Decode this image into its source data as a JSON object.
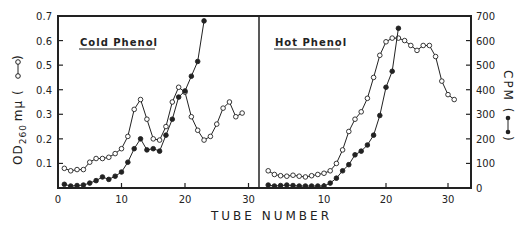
{
  "chart_data": {
    "type": "line",
    "title": "",
    "xlabel": "TUBE NUMBER",
    "ylabel_left": "OD260 mμ (○—○)",
    "ylabel_right": "CPM (●—●)",
    "left_axis": {
      "min": 0,
      "max": 0.7,
      "ticks": [
        "0.1",
        "0.2",
        "0.3",
        "0.4",
        "0.5",
        "0.6",
        "0.7"
      ]
    },
    "right_axis": {
      "min": 0,
      "max": 700,
      "ticks": [
        "0",
        "100",
        "200",
        "300",
        "400",
        "500",
        "600",
        "700"
      ]
    },
    "x_ticks": [
      "0",
      "10",
      "20",
      "30"
    ],
    "grid": false,
    "panels": [
      {
        "label": "Cold Phenol",
        "series": [
          {
            "name": "OD260 (open circles)",
            "marker": "open",
            "x": [
              1,
              2,
              3,
              4,
              5,
              6,
              7,
              8,
              9,
              10,
              11,
              12,
              13,
              14,
              15,
              16,
              17,
              18,
              19,
              20,
              21,
              22,
              23,
              24,
              25,
              26,
              27,
              28,
              29
            ],
            "values": [
              0.08,
              0.07,
              0.075,
              0.075,
              0.105,
              0.12,
              0.12,
              0.125,
              0.14,
              0.16,
              0.21,
              0.32,
              0.36,
              0.28,
              0.2,
              0.195,
              0.25,
              0.35,
              0.41,
              0.39,
              0.29,
              0.235,
              0.195,
              0.21,
              0.26,
              0.325,
              0.35,
              0.29,
              0.305
            ]
          },
          {
            "name": "CPM (filled circles)",
            "marker": "filled",
            "x": [
              1,
              2,
              3,
              4,
              5,
              6,
              7,
              8,
              9,
              10,
              11,
              12,
              13,
              14,
              15,
              16,
              17,
              18,
              19,
              20,
              21,
              22,
              23
            ],
            "values": [
              15,
              8,
              10,
              12,
              20,
              30,
              45,
              35,
              48,
              65,
              105,
              160,
              200,
              155,
              160,
              150,
              215,
              280,
              370,
              395,
              455,
              515,
              680
            ]
          }
        ]
      },
      {
        "label": "Hot Phenol",
        "series": [
          {
            "name": "OD260 (open circles)",
            "marker": "open",
            "x": [
              1,
              2,
              3,
              4,
              5,
              6,
              7,
              8,
              9,
              10,
              11,
              12,
              13,
              14,
              15,
              16,
              17,
              18,
              19,
              20,
              21,
              22,
              23,
              24,
              25,
              26,
              27,
              28,
              29,
              30,
              31
            ],
            "values": [
              0.07,
              0.055,
              0.05,
              0.048,
              0.052,
              0.048,
              0.045,
              0.05,
              0.055,
              0.06,
              0.07,
              0.1,
              0.155,
              0.23,
              0.28,
              0.31,
              0.365,
              0.45,
              0.54,
              0.595,
              0.61,
              0.61,
              0.6,
              0.58,
              0.56,
              0.58,
              0.58,
              0.535,
              0.435,
              0.38,
              0.36
            ]
          },
          {
            "name": "CPM (filled circles)",
            "marker": "filled",
            "x": [
              1,
              2,
              3,
              4,
              5,
              6,
              7,
              8,
              9,
              10,
              11,
              12,
              13,
              14,
              15,
              16,
              17,
              18,
              19,
              20,
              21,
              22
            ],
            "values": [
              12,
              8,
              10,
              12,
              10,
              8,
              8,
              8,
              8,
              8,
              20,
              40,
              70,
              95,
              135,
              150,
              175,
              215,
              295,
              410,
              475,
              650
            ]
          }
        ]
      }
    ]
  },
  "labels": {
    "xlabel": "TUBE NUMBER",
    "ylabel_left_main": "OD",
    "ylabel_left_sub": "260",
    "ylabel_left_unit": "mμ (",
    "ylabel_left_close": ")",
    "ylabel_right_main": "CPM (",
    "ylabel_right_close": ")",
    "panel_left": "Cold Phenol",
    "panel_right": "Hot Phenol"
  }
}
